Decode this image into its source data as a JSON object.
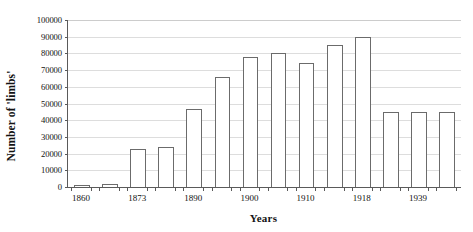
{
  "chart_data": {
    "type": "bar",
    "title": "",
    "subtitle": "",
    "xlabel": "Years",
    "ylabel": "Number of 'limbs'",
    "ylim": [
      0,
      100000
    ],
    "ytick_values": [
      0,
      10000,
      20000,
      30000,
      40000,
      50000,
      60000,
      70000,
      80000,
      90000,
      100000
    ],
    "ytick_labels": [
      "0",
      "10000",
      "20000",
      "30000",
      "40000",
      "50000",
      "60000",
      "70000",
      "80000",
      "90000",
      "100000"
    ],
    "grid": true,
    "legend": null,
    "legend_position": "none",
    "bar_style": {
      "fill": "#ffffff",
      "edge": "#6b6b6b"
    },
    "categories": [
      "1860",
      "",
      "1873",
      "",
      "1890",
      "",
      "1900",
      "",
      "1910",
      "",
      "1918",
      "",
      "1939",
      ""
    ],
    "xtick_labels_shown": [
      "1860",
      "1873",
      "1890",
      "1900",
      "1910",
      "1918",
      "1939"
    ],
    "xtick_label_bar_indices": [
      0,
      2,
      4,
      6,
      8,
      10,
      12
    ],
    "values": [
      1200,
      2000,
      22500,
      24000,
      46500,
      66000,
      78000,
      80000,
      74000,
      85000,
      90000,
      45000,
      45000,
      45000
    ],
    "n_bars": 14
  },
  "axis": {
    "y_title": "Number of 'limbs'",
    "x_title": "Years"
  }
}
